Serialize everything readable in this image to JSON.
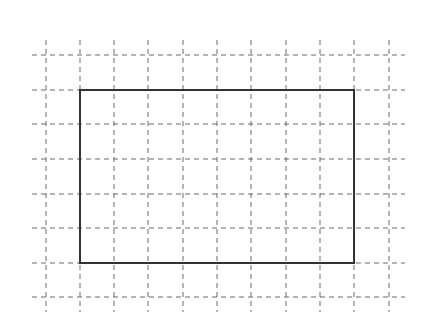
{
  "diagram": {
    "type": "grid-with-rectangle",
    "grid": {
      "columns_x": [
        46,
        80,
        114,
        148,
        183,
        217,
        251,
        286,
        320,
        354,
        389
      ],
      "rows_y": [
        55,
        90,
        124,
        159,
        194,
        228,
        263,
        297
      ],
      "h_extent": [
        32,
        405
      ],
      "v_extent": [
        40,
        312
      ],
      "cell_size": 34.3,
      "line_color": "#6b6b6b",
      "dash": "5,4",
      "line_style": "dashed"
    },
    "rectangle": {
      "x": 80,
      "y": 90,
      "width": 274,
      "height": 173,
      "cells_wide": 8,
      "cells_tall": 5,
      "stroke_color": "#333333",
      "stroke_width": 2
    },
    "background_color": "#ffffff"
  }
}
